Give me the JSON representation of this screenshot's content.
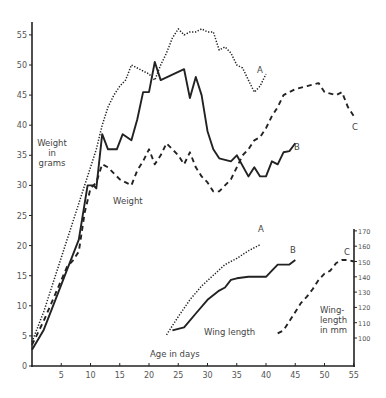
{
  "chart_data": [
    {
      "type": "line",
      "title": "Weight",
      "xlabel": "Age in days",
      "ylabel": "Weight in grams",
      "xlim": [
        0,
        55
      ],
      "ylim": [
        0,
        57
      ],
      "xticks": [
        5,
        10,
        15,
        20,
        25,
        30,
        35,
        40,
        45,
        50,
        55
      ],
      "yticks": [
        0,
        5,
        10,
        15,
        20,
        25,
        30,
        35,
        40,
        45,
        50,
        55
      ],
      "grid": false,
      "series": [
        {
          "name": "A",
          "style": "dotted",
          "x": [
            0,
            2,
            4,
            6,
            8,
            10,
            11,
            12,
            13,
            14,
            15,
            16,
            17,
            18,
            19,
            20,
            21,
            22,
            23,
            24,
            25,
            26,
            27,
            28,
            29,
            30,
            31,
            32,
            33,
            34,
            35,
            36,
            37,
            38,
            39,
            40
          ],
          "y": [
            4,
            9,
            15,
            21,
            27,
            33,
            36,
            40,
            43,
            45,
            46.5,
            47.5,
            50,
            49.5,
            49,
            48.5,
            47.5,
            50,
            52,
            54.5,
            56,
            55,
            55.5,
            55.5,
            56,
            55.5,
            55.5,
            52.5,
            53,
            52,
            50,
            49.5,
            47.5,
            45.5,
            46.5,
            48.5
          ]
        },
        {
          "name": "B",
          "style": "solid",
          "x": [
            0,
            2,
            4,
            6,
            8,
            9.5,
            10.5,
            11,
            12,
            13,
            14.5,
            15.5,
            17,
            18,
            19,
            20,
            21,
            22,
            26,
            27,
            28,
            29,
            30,
            31,
            32,
            34,
            35,
            37,
            38,
            39,
            40,
            41,
            42,
            43,
            44,
            45
          ],
          "y": [
            2.7,
            6,
            11,
            16,
            21,
            30,
            30,
            29.5,
            38.5,
            36,
            36,
            38.5,
            37.5,
            41,
            45.5,
            45.5,
            50.5,
            47.5,
            49.3,
            44.5,
            48,
            45,
            39,
            36,
            34.5,
            34,
            35,
            31.5,
            33,
            31.5,
            31.5,
            34,
            33.5,
            35.5,
            35.7,
            37
          ]
        },
        {
          "name": "C",
          "style": "dashed",
          "x": [
            0,
            2,
            4,
            6,
            7,
            8,
            9,
            10,
            11,
            12,
            13,
            14,
            15,
            16,
            17,
            18,
            19,
            20,
            21,
            22,
            23,
            24,
            25,
            26,
            27,
            28,
            29,
            30,
            31,
            32,
            33,
            34,
            35,
            36,
            37,
            38,
            39,
            40,
            41,
            42,
            43,
            44,
            45,
            47,
            49,
            50,
            52,
            53,
            54,
            55
          ],
          "y": [
            3.5,
            7.5,
            12,
            16.5,
            17.5,
            19,
            25.5,
            29.5,
            30.5,
            33.5,
            33,
            32,
            31,
            30.5,
            30,
            32.5,
            34,
            36,
            33.5,
            35,
            37,
            36,
            35,
            33.5,
            35.5,
            33,
            31.5,
            30.5,
            29,
            29,
            30,
            31,
            33,
            35,
            36,
            37.5,
            38,
            39.5,
            41.5,
            43,
            45,
            45.5,
            46,
            46.5,
            47,
            45.5,
            45,
            45.5,
            43,
            41.5
          ]
        }
      ],
      "annotations": [
        "A",
        "B",
        "C",
        "Weight in grams",
        "Weight"
      ]
    },
    {
      "type": "line",
      "title": "Wing length",
      "xlabel": "Age in days",
      "ylabel": "Wing-length in mm",
      "y_axis_position": "right",
      "ylim": [
        90,
        172
      ],
      "yticks": [
        100,
        110,
        120,
        130,
        140,
        150,
        160,
        170
      ],
      "grid": false,
      "series": [
        {
          "name": "A",
          "style": "dotted",
          "x": [
            23,
            25,
            27,
            29,
            31,
            33,
            35,
            37,
            39
          ],
          "y": [
            102,
            114,
            125,
            134,
            141,
            148,
            152,
            157,
            161
          ]
        },
        {
          "name": "B",
          "style": "solid",
          "x": [
            24,
            26,
            28,
            30,
            32,
            33,
            34,
            35,
            37,
            39,
            40,
            41,
            42,
            44,
            45
          ],
          "y": [
            105,
            107,
            116,
            125,
            131,
            133,
            138,
            139,
            140,
            140,
            140,
            144,
            148,
            148,
            151
          ]
        },
        {
          "name": "C",
          "style": "dashed",
          "x": [
            42,
            43,
            44,
            45,
            46,
            47,
            48,
            49,
            50,
            51,
            52,
            53,
            54,
            55
          ],
          "y": [
            103,
            105,
            111,
            117,
            123,
            127,
            132,
            138,
            142,
            144,
            149,
            151,
            151,
            150
          ]
        }
      ],
      "annotations": [
        "A",
        "B",
        "C",
        "Wing length",
        "Wing-length in mm"
      ]
    }
  ],
  "labels": {
    "weight_axis_l1": "Weight",
    "weight_axis_l2": "in",
    "weight_axis_l3": "grams",
    "weight_caption": "Weight",
    "wing_caption": "Wing length",
    "wing_axis_l1": "Wing-",
    "wing_axis_l2": "length",
    "wing_axis_l3": "in mm",
    "x_caption": "Age in days",
    "weight_A": "A",
    "weight_B": "B",
    "weight_C": "C",
    "wing_A": "A",
    "wing_B": "B",
    "wing_C": "C"
  }
}
